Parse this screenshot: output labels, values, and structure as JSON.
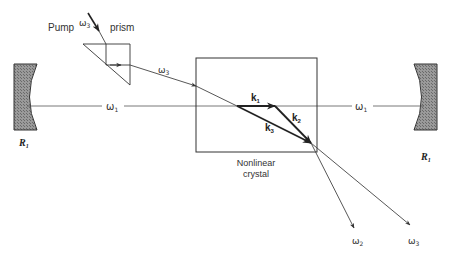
{
  "figure": {
    "labels": {
      "pump": "Pump",
      "prism": "prism",
      "pump_freq": "ω",
      "pump_freq_sub": "3",
      "pump_beam_freq": "ω",
      "pump_beam_freq_sub": "3",
      "cavity_left_freq": "ω",
      "cavity_left_freq_sub": "1",
      "cavity_right_freq": "ω",
      "cavity_right_freq_sub": "1",
      "k1": "k",
      "k1_sub": "1",
      "k2": "k",
      "k2_sub": "2",
      "k3": "k",
      "k3_sub": "3",
      "crystal_line1": "Nonlinear",
      "crystal_line2": "crystal",
      "out_idler": "ω",
      "out_idler_sub": "2",
      "out_pump": "ω",
      "out_pump_sub": "3",
      "mirror_left": "R",
      "mirror_left_sub": "1",
      "mirror_right": "R",
      "mirror_right_sub": "1"
    },
    "colors": {
      "line": "#555555",
      "vector": "#222222",
      "mirror_fill": "#8a8a8a"
    }
  }
}
